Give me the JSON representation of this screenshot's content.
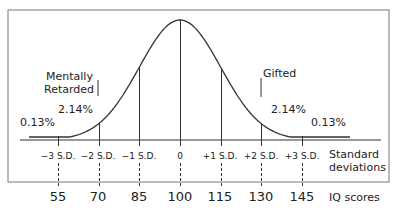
{
  "chart_data": {
    "type": "line",
    "title": "",
    "xlabel": "IQ scores",
    "secondary_xlabel": "Standard deviations",
    "ylabel": "",
    "x": [
      55,
      70,
      85,
      100,
      115,
      130,
      145
    ],
    "sd_labels": [
      "−3 S.D.",
      "−2 S.D.",
      "−1 S.D.",
      "0",
      "+1 S.D.",
      "+2 S.D.",
      "+3 S.D."
    ],
    "iq_labels": [
      "55",
      "70",
      "85",
      "100",
      "115",
      "130",
      "145"
    ],
    "series": [
      {
        "name": "Normal distribution",
        "mean": 100,
        "sd": 15
      }
    ],
    "annotations": [
      {
        "text": "0.13%",
        "position": "left tail beyond -3 S.D."
      },
      {
        "text": "2.14%",
        "position": "between -3 and -2 S.D."
      },
      {
        "text": "2.14%",
        "position": "between +2 and +3 S.D."
      },
      {
        "text": "0.13%",
        "position": "right tail beyond +3 S.D."
      },
      {
        "text": "Mentally Retarded",
        "position": "left, near -2 S.D."
      },
      {
        "text": "Gifted",
        "position": "right, near +2 S.D."
      }
    ],
    "grid": false,
    "legend": "none"
  },
  "labels": {
    "mentally": "Mentally",
    "retarded": "Retarded",
    "gifted": "Gifted",
    "left_214": "2.14%",
    "left_013": "0.13%",
    "right_214": "2.14%",
    "right_013": "0.13%",
    "standard": "Standard",
    "deviations": "deviations",
    "iq_scores": "IQ scores"
  }
}
